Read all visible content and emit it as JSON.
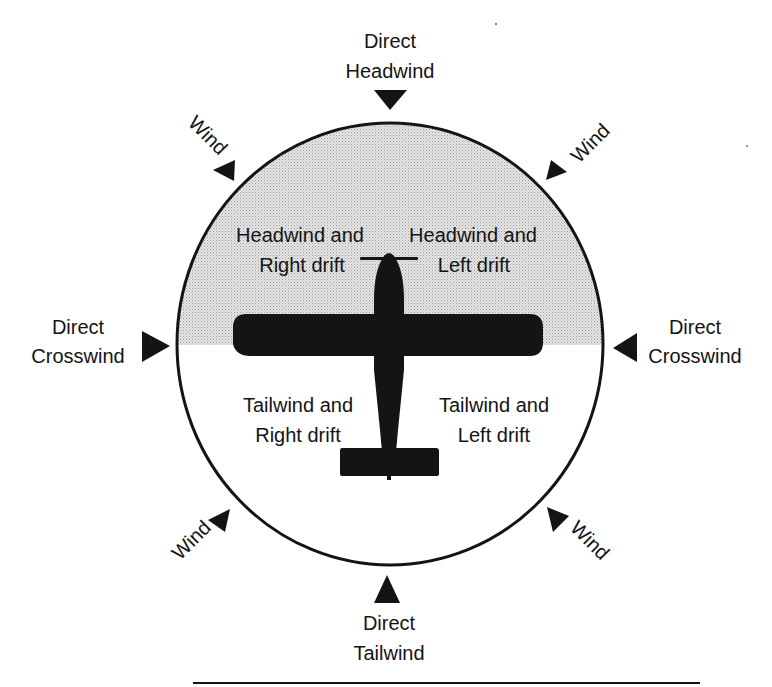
{
  "diagram": {
    "type": "wind-direction-diagram",
    "colors": {
      "ink": "#141414",
      "shade": "#d4d4d4",
      "background": "#ffffff"
    },
    "outer_labels": {
      "top": {
        "line1": "Direct",
        "line2": "Headwind"
      },
      "left": {
        "line1": "Direct",
        "line2": "Crosswind"
      },
      "right": {
        "line1": "Direct",
        "line2": "Crosswind"
      },
      "bottom": {
        "line1": "Direct",
        "line2": "Tailwind"
      },
      "top_left": "Wind",
      "top_right": "Wind",
      "bottom_left": "Wind",
      "bottom_right": "Wind"
    },
    "quadrants": {
      "upper_left": {
        "line1": "Headwind and",
        "line2": "Right drift"
      },
      "upper_right": {
        "line1": "Headwind and",
        "line2": "Left drift"
      },
      "lower_left": {
        "line1": "Tailwind and",
        "line2": "Right drift"
      },
      "lower_right": {
        "line1": "Tailwind and",
        "line2": "Left drift"
      }
    },
    "icons": {
      "aircraft": "airplane-top-view-silhouette",
      "arrows": "triangle-pointer"
    }
  }
}
